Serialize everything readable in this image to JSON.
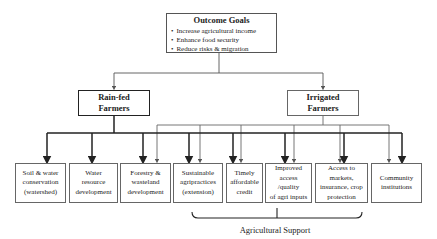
{
  "outcome": {
    "title": "Outcome Goals",
    "bullets": [
      "Increase agricultural income",
      "Enhance food security",
      "Reduce risks & migration"
    ]
  },
  "farmers": {
    "rainfed": {
      "line1": "Rain-fed",
      "line2": "Farmers"
    },
    "irrigated": {
      "line1": "Irrigated",
      "line2": "Farmers"
    }
  },
  "interventions": [
    {
      "lines": [
        "Soil & water",
        "conservation",
        "(watershed)"
      ]
    },
    {
      "lines": [
        "Water",
        "resource",
        "development"
      ]
    },
    {
      "lines": [
        "Forestry &",
        "wasteland",
        "development"
      ]
    },
    {
      "lines": [
        "Sustainable",
        "agripractices",
        "(extension)"
      ]
    },
    {
      "lines": [
        "Timely",
        "affordable",
        "credit"
      ]
    },
    {
      "lines": [
        "Improved",
        "access",
        "/quality",
        "of agri inputs"
      ]
    },
    {
      "lines": [
        "Access to",
        "markets,",
        "insurance, crop",
        "protection"
      ]
    },
    {
      "lines": [
        "Community",
        "institutions"
      ]
    }
  ],
  "bracket": {
    "label": "Agricultural Support"
  },
  "colors": {
    "thick_line": "#222222",
    "thin_line": "#666666",
    "box_border": "#666666"
  }
}
